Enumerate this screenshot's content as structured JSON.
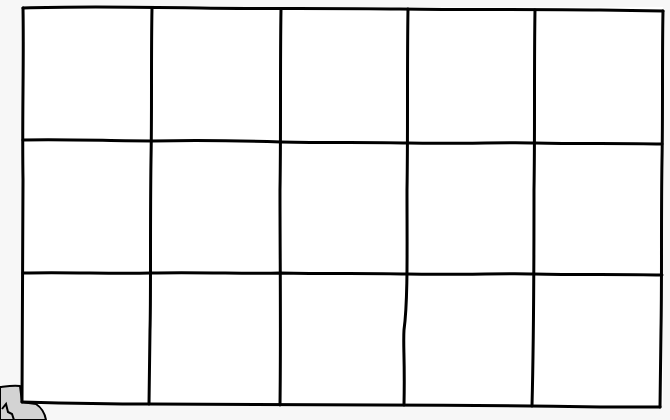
{
  "grid": {
    "rows": 3,
    "columns": 5,
    "cells": [
      [
        "",
        "",
        "",
        "",
        ""
      ],
      [
        "",
        "",
        "",
        "",
        ""
      ],
      [
        "",
        "",
        "",
        "",
        ""
      ]
    ],
    "line_color": "#000000",
    "cell_background": "#ffffff"
  },
  "page": {
    "background": "#f7f7f7"
  },
  "corner_sticker": {
    "color": "#d3d3d3",
    "glyph": "partial-letter"
  }
}
